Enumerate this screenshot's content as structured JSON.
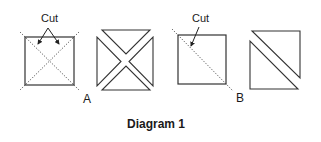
{
  "diagram": {
    "title": "Diagram 1",
    "figures": [
      {
        "id": "A",
        "label": "A",
        "cut_label": "Cut",
        "description": "Square with both diagonals dotted as cut lines; cut into four quarter-square triangles"
      },
      {
        "id": "B",
        "label": "B",
        "cut_label": "Cut",
        "description": "Square with one diagonal dotted as cut line; cut into two half-square triangles"
      }
    ],
    "colors": {
      "line": "#333333",
      "background": "#ffffff"
    }
  }
}
